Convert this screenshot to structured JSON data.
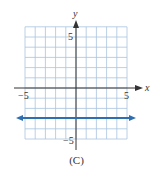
{
  "chart_data": {
    "type": "line",
    "title": "",
    "xlabel": "x",
    "ylabel": "y",
    "xlim": [
      -5,
      5
    ],
    "ylim": [
      -5,
      6
    ],
    "grid": true,
    "x_tick_labels": [
      {
        "value": -5,
        "label": "−5"
      },
      {
        "value": 5,
        "label": "5"
      }
    ],
    "y_tick_labels": [
      {
        "value": 5,
        "label": "5"
      },
      {
        "value": -5,
        "label": "−5"
      }
    ],
    "series": [
      {
        "name": "horizontal line",
        "equation": "y = -3",
        "x": [
          -5,
          5
        ],
        "y": [
          -3,
          -3
        ],
        "color": "#2f6fb0",
        "arrows": "both"
      }
    ],
    "caption": "(C)"
  },
  "labels": {
    "x_axis": "x",
    "y_axis": "y",
    "x_min": "−5",
    "x_max": "5",
    "y_max": "5",
    "y_min": "−5",
    "caption": "(C)"
  },
  "colors": {
    "grid": "#a9c4de",
    "axis": "#333333",
    "line": "#2f6fb0"
  }
}
